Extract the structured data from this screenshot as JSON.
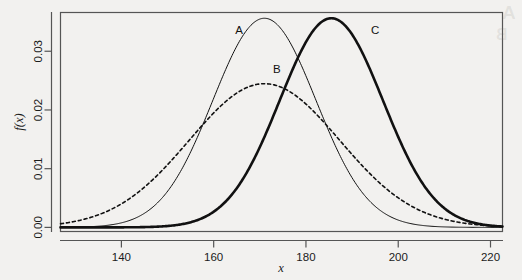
{
  "figure": {
    "background_color": "#f2f1ef",
    "plot_frame_color": "#555555",
    "ghost_text": {
      "line1": "A ",
      "line2": "B ",
      "line3": " "
    }
  },
  "chart_data": {
    "type": "line",
    "title": "",
    "subtitle": "",
    "xlabel": "x",
    "ylabel": "f(x)",
    "xlim": [
      126.8,
      222.6
    ],
    "ylim": [
      -0.0007,
      0.0366
    ],
    "grid": false,
    "legend_position": "inline-annotations",
    "xticks": [
      140,
      160,
      180,
      200,
      220
    ],
    "xticklabels": [
      "140",
      "160",
      "180",
      "200",
      "220"
    ],
    "yticks": [
      0.0,
      0.01,
      0.02,
      0.03
    ],
    "yticklabels": [
      "0.00",
      "0.01",
      "0.02",
      "0.03"
    ],
    "annotations": [
      {
        "text": "A",
        "x": 165.5,
        "y": 0.033
      },
      {
        "text": "B",
        "x": 173.7,
        "y": 0.0263
      },
      {
        "text": "C",
        "x": 195.0,
        "y": 0.033
      }
    ],
    "series": [
      {
        "name": "A",
        "label": "A",
        "distribution": "normal",
        "mean": 171.0,
        "sd": 11.2,
        "peak_value": 0.0356,
        "style": "solid",
        "linewidth": 1.0,
        "color": "#111111",
        "x": [
          130,
          135,
          140,
          145,
          150,
          155,
          160,
          165,
          170,
          171,
          175,
          180,
          185,
          190,
          195,
          200,
          205,
          210,
          215,
          220
        ],
        "values": [
          0.00011,
          0.00042,
          0.00128,
          0.00325,
          0.00688,
          0.01216,
          0.01797,
          0.02219,
          0.03504,
          0.0356,
          0.03271,
          0.02219,
          0.01216,
          0.00554,
          0.00211,
          0.00067,
          0.00018,
          4e-05,
          1e-05,
          1e-06
        ]
      },
      {
        "name": "B",
        "label": "B",
        "distribution": "normal",
        "mean": 171.0,
        "sd": 16.3,
        "peak_value": 0.0245,
        "style": "dashed",
        "linewidth": 1.6,
        "dash_pattern": "3,3",
        "color": "#111111",
        "x": [
          130,
          135,
          140,
          145,
          150,
          155,
          160,
          165,
          170,
          171,
          175,
          180,
          185,
          190,
          195,
          200,
          205,
          210,
          215,
          220
        ],
        "values": [
          0.0018,
          0.00339,
          0.00587,
          0.0093,
          0.01352,
          0.01803,
          0.02203,
          0.02418,
          0.02444,
          0.0244,
          0.02298,
          0.0191,
          0.01425,
          0.00973,
          0.00609,
          0.00349,
          0.00183,
          0.00088,
          0.00039,
          0.00015
        ]
      },
      {
        "name": "C",
        "label": "C",
        "distribution": "normal",
        "mean": 185.5,
        "sd": 11.2,
        "peak_value": 0.0356,
        "style": "solid",
        "linewidth": 2.6,
        "color": "#111111",
        "x": [
          130,
          140,
          150,
          155,
          160,
          165,
          170,
          175,
          180,
          185,
          185.5,
          190,
          195,
          200,
          205,
          210,
          215,
          220
        ],
        "values": [
          2e-07,
          8e-06,
          0.00018,
          0.00067,
          0.00211,
          0.00554,
          0.01216,
          0.02219,
          0.03271,
          0.03554,
          0.0356,
          0.03271,
          0.02219,
          0.01216,
          0.00554,
          0.00211,
          0.00067,
          0.00018
        ]
      }
    ]
  }
}
